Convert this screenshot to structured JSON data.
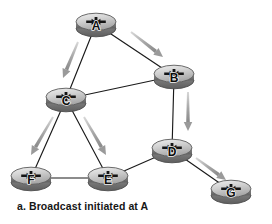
{
  "figure": {
    "caption": "a. Broadcast initiated at A",
    "background_color": "#ffffff",
    "node_fill_top": "#d9d9d9",
    "node_fill_side": "#8c8c8c",
    "node_stroke": "#4d4d4d",
    "edge_color": "#1a1a1a",
    "arrow_color": "#9a9a9a",
    "label_color": "#0d0d0d",
    "icon_name": "router-icon",
    "nodes": [
      {
        "id": "A",
        "label": "A",
        "x": 96,
        "y": 24
      },
      {
        "id": "B",
        "label": "B",
        "x": 174,
        "y": 76
      },
      {
        "id": "C",
        "label": "C",
        "x": 66,
        "y": 99
      },
      {
        "id": "D",
        "label": "D",
        "x": 172,
        "y": 150
      },
      {
        "id": "E",
        "label": "E",
        "x": 108,
        "y": 178
      },
      {
        "id": "F",
        "label": "F",
        "x": 31,
        "y": 178
      },
      {
        "id": "G",
        "label": "G",
        "x": 231,
        "y": 191
      }
    ],
    "edges": [
      {
        "from": "A",
        "to": "C"
      },
      {
        "from": "A",
        "to": "B"
      },
      {
        "from": "C",
        "to": "B"
      },
      {
        "from": "B",
        "to": "D"
      },
      {
        "from": "C",
        "to": "F"
      },
      {
        "from": "C",
        "to": "E"
      },
      {
        "from": "F",
        "to": "E"
      },
      {
        "from": "E",
        "to": "D"
      },
      {
        "from": "D",
        "to": "G"
      }
    ],
    "flow_arrows": [
      {
        "from": "A",
        "to": "C",
        "x1": 78,
        "y1": 42,
        "x2": 63,
        "y2": 78
      },
      {
        "from": "A",
        "to": "B",
        "x1": 131,
        "y1": 32,
        "x2": 163,
        "y2": 57
      },
      {
        "from": "B",
        "to": "D",
        "x1": 188,
        "y1": 92,
        "x2": 188,
        "y2": 131
      },
      {
        "from": "C",
        "to": "F",
        "x1": 53,
        "y1": 117,
        "x2": 31,
        "y2": 155
      },
      {
        "from": "C",
        "to": "E",
        "x1": 84,
        "y1": 117,
        "x2": 106,
        "y2": 155
      },
      {
        "from": "D",
        "to": "G",
        "x1": 196,
        "y1": 158,
        "x2": 226,
        "y2": 180
      }
    ]
  }
}
